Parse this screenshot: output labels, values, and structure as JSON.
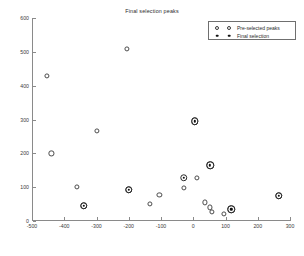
{
  "chart_data": {
    "type": "scatter",
    "title": "Final selection peaks",
    "xlabel": "",
    "ylabel": "",
    "xlim": [
      -500,
      300
    ],
    "ylim": [
      0,
      600
    ],
    "xticks": [
      -500,
      -400,
      -300,
      -200,
      -100,
      0,
      100,
      200,
      300
    ],
    "xtick_labels": [
      "-500",
      "-400",
      "-300",
      "-200",
      "-100",
      "0",
      "100",
      "200",
      "300"
    ],
    "yticks": [
      0,
      100,
      200,
      300,
      400,
      500,
      600
    ],
    "ytick_labels": [
      "0",
      "100",
      "200",
      "300",
      "400",
      "500",
      "600"
    ],
    "grid": false,
    "legend_position": "top-right",
    "series": [
      {
        "name": "Pre-selected peaks",
        "marker": "open-circle",
        "color": "#4a4a4a",
        "points": [
          {
            "x": -455,
            "y": 428
          },
          {
            "x": -205,
            "y": 508
          },
          {
            "x": -440,
            "y": 200
          },
          {
            "x": -300,
            "y": 267
          },
          {
            "x": -360,
            "y": 100
          },
          {
            "x": -200,
            "y": 92
          },
          {
            "x": -105,
            "y": 78
          },
          {
            "x": -30,
            "y": 98
          },
          {
            "x": 12,
            "y": 128
          },
          {
            "x": -340,
            "y": 45
          },
          {
            "x": -135,
            "y": 50
          },
          {
            "x": 35,
            "y": 55
          },
          {
            "x": 52,
            "y": 40
          },
          {
            "x": 58,
            "y": 26
          },
          {
            "x": 95,
            "y": 22
          },
          {
            "x": 5,
            "y": 295
          },
          {
            "x": 52,
            "y": 165
          },
          {
            "x": 118,
            "y": 35
          },
          {
            "x": 265,
            "y": 75
          }
        ]
      },
      {
        "name": "Final selection",
        "marker": "circled-dot",
        "color": "#111111",
        "points": [
          {
            "x": 5,
            "y": 295
          },
          {
            "x": 52,
            "y": 165
          },
          {
            "x": -30,
            "y": 128
          },
          {
            "x": -200,
            "y": 92
          },
          {
            "x": -340,
            "y": 45
          },
          {
            "x": 118,
            "y": 35
          },
          {
            "x": 265,
            "y": 75
          }
        ]
      }
    ]
  },
  "legend": {
    "entries": [
      {
        "label": "Pre-selected peaks"
      },
      {
        "label": "Final selection"
      }
    ]
  }
}
